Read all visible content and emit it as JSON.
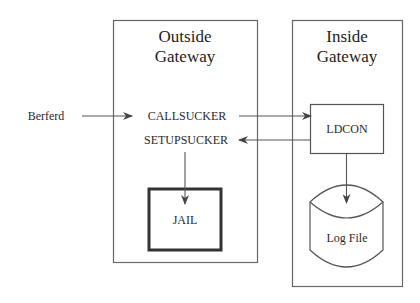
{
  "diagram": {
    "outside_gateway": {
      "title_line1": "Outside",
      "title_line2": "Gateway",
      "callsucker": "CALLSUCKER",
      "setupsucker": "SETUPSUCKER",
      "jail": "JAIL"
    },
    "inside_gateway": {
      "title_line1": "Inside",
      "title_line2": "Gateway",
      "ldcon": "LDCON",
      "log_file": "Log File"
    },
    "external": {
      "source": "Berferd"
    },
    "edges": [
      {
        "from": "Berferd",
        "to": "CALLSUCKER"
      },
      {
        "from": "CALLSUCKER",
        "to": "LDCON"
      },
      {
        "from": "LDCON",
        "to": "SETUPSUCKER"
      },
      {
        "from": "SETUPSUCKER",
        "to": "JAIL"
      },
      {
        "from": "LDCON",
        "to": "Log File"
      }
    ],
    "colors": {
      "line": "#555555",
      "text": "#2a2a2a"
    }
  }
}
